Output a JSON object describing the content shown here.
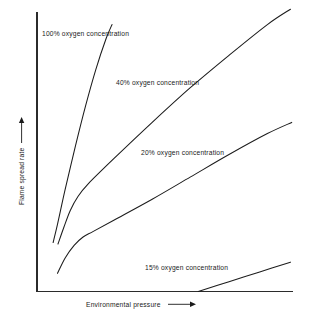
{
  "figure": {
    "background": "#ffffff",
    "line_color": "#1c1c1c",
    "text_color": "#1a1a1a"
  },
  "axes": {
    "x_title": "Environmental pressure",
    "y_title": "Flame spread rate",
    "x_arrow": "right-arrow-icon",
    "y_arrow": "up-arrow-icon"
  },
  "chart_data": {
    "type": "line",
    "title": "",
    "xlabel": "Environmental pressure",
    "ylabel": "Flame spread rate",
    "xlim": [
      0,
      100
    ],
    "ylim": [
      0,
      100
    ],
    "grid": false,
    "axis_ticks": false,
    "legend": "inline-annotations",
    "series": [
      {
        "name": "100% oxygen concentration",
        "label": "100% oxygen concentration",
        "label_x": 15,
        "label_y": 92,
        "x": [
          6.3,
          8.0,
          11.0,
          15.0,
          19.0,
          23.0,
          27.0,
          29.3
        ],
        "y": [
          17.5,
          24.0,
          36.5,
          52.0,
          66.5,
          79.5,
          90.5,
          95.5
        ]
      },
      {
        "name": "40% oxygen concentration",
        "label": "40% oxygen concentration",
        "label_x": 36,
        "label_y": 76,
        "x": [
          8.2,
          10.5,
          13.0,
          16.0,
          20.0,
          30.0,
          45.0,
          60.0,
          75.0,
          90.0,
          99.0
        ],
        "y": [
          17.0,
          23.0,
          29.0,
          34.0,
          38.5,
          47.5,
          60.5,
          73.0,
          84.5,
          95.5,
          101.0
        ]
      },
      {
        "name": "20% oxygen concentration",
        "label": "20% oxygen concentration",
        "label_x": 46,
        "label_y": 50,
        "x": [
          8.0,
          11.0,
          14.5,
          18.0,
          22.0,
          30.0,
          45.0,
          60.0,
          75.0,
          90.0,
          99.5
        ],
        "y": [
          6.5,
          12.0,
          16.5,
          19.5,
          21.5,
          25.5,
          33.0,
          41.0,
          49.0,
          56.5,
          60.5
        ]
      },
      {
        "name": "15% oxygen concentration",
        "label": "15% oxygen concentration",
        "label_x": 47,
        "label_y": 12,
        "x": [
          63.0,
          75.0,
          87.0,
          99.0
        ],
        "y": [
          0.0,
          3.5,
          7.0,
          10.5
        ]
      }
    ]
  }
}
